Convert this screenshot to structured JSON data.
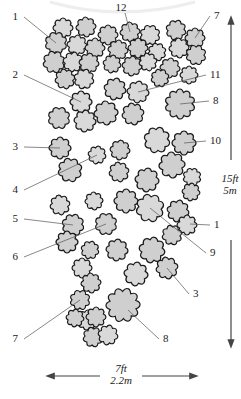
{
  "diagram": {
    "type": "planting-plan",
    "colors": {
      "plant_fill": "#cfcfcf",
      "plant_fill_light": "#d9d9d9",
      "plant_stroke": "#1a1a1a",
      "leader": "#555555",
      "arrow": "#444444",
      "text": "#222222"
    },
    "labels": [
      {
        "id": "1",
        "text": "1",
        "x": 18,
        "y": 20
      },
      {
        "id": "12",
        "text": "12",
        "x": 121,
        "y": 11
      },
      {
        "id": "7",
        "text": "7",
        "x": 214,
        "y": 19
      },
      {
        "id": "2",
        "text": "2",
        "x": 18,
        "y": 78
      },
      {
        "id": "11",
        "text": "11",
        "x": 210,
        "y": 78
      },
      {
        "id": "8",
        "text": "8",
        "x": 213,
        "y": 104
      },
      {
        "id": "3",
        "text": "3",
        "x": 18,
        "y": 150
      },
      {
        "id": "10",
        "text": "10",
        "x": 210,
        "y": 144
      },
      {
        "id": "4",
        "text": "4",
        "x": 18,
        "y": 193
      },
      {
        "id": "5",
        "text": "5",
        "x": 18,
        "y": 222
      },
      {
        "id": "1b",
        "text": "1",
        "x": 214,
        "y": 228
      },
      {
        "id": "6",
        "text": "6",
        "x": 18,
        "y": 260
      },
      {
        "id": "9",
        "text": "9",
        "x": 210,
        "y": 256
      },
      {
        "id": "3b",
        "text": "3",
        "x": 193,
        "y": 297
      },
      {
        "id": "7b",
        "text": "7",
        "x": 18,
        "y": 342
      },
      {
        "id": "8b",
        "text": "8",
        "x": 163,
        "y": 342
      }
    ],
    "dimensions": {
      "height_ft": "15ft",
      "height_m": "5m",
      "width_ft": "7ft",
      "width_m": "2.2m"
    }
  }
}
